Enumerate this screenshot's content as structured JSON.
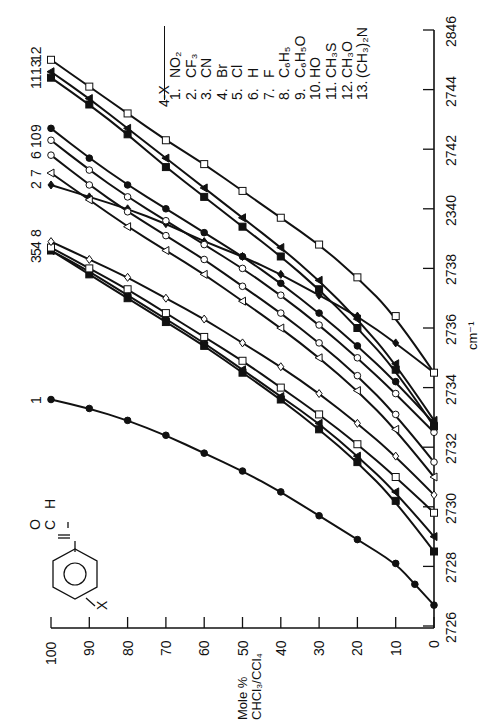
{
  "chart_data": {
    "type": "line",
    "orientation": "rotated-90-ccw",
    "title": "",
    "xlabel": "cm⁻¹",
    "ylabel": "Mole % CHCl₃/CCl₄",
    "x_axis": {
      "ticks": [
        2726,
        2728,
        2730,
        2732,
        2734,
        2736,
        2738,
        2740,
        2742,
        2744,
        2746
      ],
      "tick_labels": [
        "2726",
        "2728",
        "2730",
        "2732",
        "2734",
        "2736",
        "2738",
        "2340",
        "2742",
        "2744",
        "2846"
      ],
      "range": [
        2726,
        2746
      ]
    },
    "y_axis": {
      "ticks": [
        0,
        10,
        20,
        30,
        40,
        50,
        60,
        70,
        80,
        90,
        100
      ],
      "tick_labels": [
        "0",
        "10",
        "20",
        "30",
        "40",
        "50",
        "60",
        "70",
        "80",
        "90",
        "100"
      ],
      "range": [
        0,
        100
      ]
    },
    "legend_title": "4-X",
    "legend": [
      {
        "id": "1",
        "label": "NO₂"
      },
      {
        "id": "2",
        "label": "CF₃"
      },
      {
        "id": "3",
        "label": "CN"
      },
      {
        "id": "4",
        "label": "Br"
      },
      {
        "id": "5",
        "label": "Cl"
      },
      {
        "id": "6",
        "label": "H"
      },
      {
        "id": "7",
        "label": "F"
      },
      {
        "id": "8",
        "label": "C₆H₅"
      },
      {
        "id": "9",
        "label": "C₆H₅O"
      },
      {
        "id": "10",
        "label": "HO"
      },
      {
        "id": "11",
        "label": "CH₃S"
      },
      {
        "id": "12",
        "label": "CH₃O"
      },
      {
        "id": "13",
        "label": "(CH₃)₂N"
      }
    ],
    "series": [
      {
        "name": "1",
        "substituent": "NO₂",
        "marker": "filled-circle",
        "points": [
          [
            2726.7,
            0
          ],
          [
            2727.4,
            5
          ],
          [
            2728.1,
            10
          ],
          [
            2728.9,
            20
          ],
          [
            2729.7,
            30
          ],
          [
            2730.5,
            40
          ],
          [
            2731.2,
            50
          ],
          [
            2731.8,
            60
          ],
          [
            2732.4,
            70
          ],
          [
            2732.9,
            80
          ],
          [
            2733.3,
            90
          ],
          [
            2733.6,
            100
          ]
        ]
      },
      {
        "name": "3",
        "substituent": "CN",
        "marker": "filled-square",
        "points": [
          [
            2728.5,
            0
          ],
          [
            2730.2,
            10
          ],
          [
            2731.5,
            20
          ],
          [
            2732.6,
            30
          ],
          [
            2733.6,
            40
          ],
          [
            2734.5,
            50
          ],
          [
            2735.4,
            60
          ],
          [
            2736.2,
            70
          ],
          [
            2737.0,
            80
          ],
          [
            2737.8,
            90
          ],
          [
            2738.6,
            100
          ]
        ]
      },
      {
        "name": "5",
        "substituent": "Cl",
        "marker": "filled-triangle",
        "points": [
          [
            2729.0,
            0
          ],
          [
            2730.5,
            10
          ],
          [
            2731.7,
            20
          ],
          [
            2732.8,
            30
          ],
          [
            2733.7,
            40
          ],
          [
            2734.6,
            50
          ],
          [
            2735.5,
            60
          ],
          [
            2736.3,
            70
          ],
          [
            2737.1,
            80
          ],
          [
            2737.9,
            90
          ],
          [
            2738.6,
            100
          ]
        ]
      },
      {
        "name": "4",
        "substituent": "Br",
        "marker": "open-square",
        "points": [
          [
            2729.8,
            0
          ],
          [
            2731.0,
            10
          ],
          [
            2732.1,
            20
          ],
          [
            2733.1,
            30
          ],
          [
            2734.0,
            40
          ],
          [
            2734.9,
            50
          ],
          [
            2735.7,
            60
          ],
          [
            2736.5,
            70
          ],
          [
            2737.3,
            80
          ],
          [
            2738.0,
            90
          ],
          [
            2738.7,
            100
          ]
        ]
      },
      {
        "name": "8",
        "substituent": "C₆H₅",
        "marker": "open-diamond",
        "points": [
          [
            2730.4,
            0
          ],
          [
            2731.7,
            10
          ],
          [
            2732.8,
            20
          ],
          [
            2733.8,
            30
          ],
          [
            2734.7,
            40
          ],
          [
            2735.5,
            50
          ],
          [
            2736.3,
            60
          ],
          [
            2737.0,
            70
          ],
          [
            2737.7,
            80
          ],
          [
            2738.3,
            90
          ],
          [
            2738.9,
            100
          ]
        ]
      },
      {
        "name": "2",
        "substituent": "CF₃",
        "marker": "filled-diamond",
        "points": [
          [
            2734.5,
            0
          ],
          [
            2735.5,
            10
          ],
          [
            2736.4,
            20
          ],
          [
            2737.1,
            30
          ],
          [
            2737.8,
            40
          ],
          [
            2738.4,
            50
          ],
          [
            2738.9,
            60
          ],
          [
            2739.5,
            70
          ],
          [
            2740.0,
            80
          ],
          [
            2740.4,
            90
          ],
          [
            2740.8,
            100
          ]
        ]
      },
      {
        "name": "7",
        "substituent": "F",
        "marker": "open-triangle",
        "points": [
          [
            2731.0,
            0
          ],
          [
            2732.6,
            10
          ],
          [
            2733.9,
            20
          ],
          [
            2735.0,
            30
          ],
          [
            2736.0,
            40
          ],
          [
            2736.9,
            50
          ],
          [
            2737.8,
            60
          ],
          [
            2738.6,
            70
          ],
          [
            2739.4,
            80
          ],
          [
            2740.3,
            90
          ],
          [
            2741.2,
            100
          ]
        ]
      },
      {
        "name": "6",
        "substituent": "H",
        "marker": "open-circle",
        "points": [
          [
            2731.5,
            0
          ],
          [
            2733.1,
            10
          ],
          [
            2734.4,
            20
          ],
          [
            2735.5,
            30
          ],
          [
            2736.5,
            40
          ],
          [
            2737.4,
            50
          ],
          [
            2738.3,
            60
          ],
          [
            2739.1,
            70
          ],
          [
            2739.9,
            80
          ],
          [
            2740.8,
            90
          ],
          [
            2741.8,
            100
          ]
        ]
      },
      {
        "name": "10",
        "substituent": "HO",
        "marker": "open-circle",
        "points": [
          [
            2732.5,
            0
          ],
          [
            2733.8,
            10
          ],
          [
            2735.0,
            20
          ],
          [
            2736.1,
            30
          ],
          [
            2737.1,
            40
          ],
          [
            2738.0,
            50
          ],
          [
            2738.8,
            60
          ],
          [
            2739.6,
            70
          ],
          [
            2740.4,
            80
          ],
          [
            2741.3,
            90
          ],
          [
            2742.3,
            100
          ]
        ]
      },
      {
        "name": "9",
        "substituent": "C₆H₅O",
        "marker": "filled-circle",
        "points": [
          [
            2732.8,
            0
          ],
          [
            2734.2,
            10
          ],
          [
            2735.4,
            20
          ],
          [
            2736.5,
            30
          ],
          [
            2737.5,
            40
          ],
          [
            2738.4,
            50
          ],
          [
            2739.2,
            60
          ],
          [
            2740.0,
            70
          ],
          [
            2740.8,
            80
          ],
          [
            2741.7,
            90
          ],
          [
            2742.7,
            100
          ]
        ]
      },
      {
        "name": "11",
        "substituent": "CH₃S",
        "marker": "filled-square",
        "points": [
          [
            2732.7,
            0
          ],
          [
            2734.6,
            10
          ],
          [
            2736.0,
            20
          ],
          [
            2737.3,
            30
          ],
          [
            2738.4,
            40
          ],
          [
            2739.4,
            50
          ],
          [
            2740.4,
            60
          ],
          [
            2741.4,
            70
          ],
          [
            2742.5,
            80
          ],
          [
            2743.5,
            90
          ],
          [
            2744.4,
            100
          ]
        ]
      },
      {
        "name": "13",
        "substituent": "(CH₃)₂N",
        "marker": "filled-triangle",
        "points": [
          [
            2732.9,
            0
          ],
          [
            2734.8,
            10
          ],
          [
            2736.3,
            20
          ],
          [
            2737.6,
            30
          ],
          [
            2738.7,
            40
          ],
          [
            2739.7,
            50
          ],
          [
            2740.7,
            60
          ],
          [
            2741.7,
            70
          ],
          [
            2742.7,
            80
          ],
          [
            2743.7,
            90
          ],
          [
            2744.6,
            100
          ]
        ]
      },
      {
        "name": "12",
        "substituent": "CH₃O",
        "marker": "open-square",
        "points": [
          [
            2734.5,
            0
          ],
          [
            2736.4,
            10
          ],
          [
            2737.7,
            20
          ],
          [
            2738.8,
            30
          ],
          [
            2739.7,
            40
          ],
          [
            2740.6,
            50
          ],
          [
            2741.5,
            60
          ],
          [
            2742.3,
            70
          ],
          [
            2743.2,
            80
          ],
          [
            2744.1,
            90
          ],
          [
            2745.0,
            100
          ]
        ]
      }
    ],
    "curve_labels_top": [
      "1",
      "3",
      "5",
      "4",
      "8",
      "2",
      "7",
      "6",
      "10",
      "9",
      "11",
      "13",
      "12"
    ],
    "inset": "4-X-benzaldehyde structure (X–C₆H₄–CHO)",
    "grid": false,
    "legend_position": "top-right (rotated)"
  },
  "structure": {
    "o": "O",
    "c": "C",
    "h": "H",
    "x": "X"
  },
  "labels": {
    "ylabel_line1": "Mole %",
    "ylabel_line2": "CHCl₃/CCl₄",
    "xlabel": "cm⁻¹"
  }
}
